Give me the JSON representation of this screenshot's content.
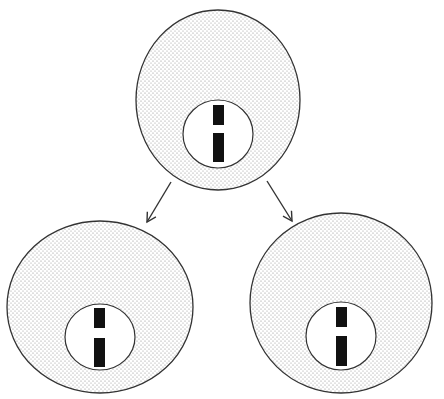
{
  "diagram": {
    "colors": {
      "background": "#ffffff",
      "outline": "#333333",
      "stipple": "#8a8a8a",
      "chromosome": "#111111",
      "arrow": "#333333"
    },
    "cells": [
      {
        "id": "parent",
        "label": "parent cell",
        "outer": {
          "cx": 218,
          "cy": 100,
          "rx": 82,
          "ry": 90
        },
        "nucleus": {
          "cx": 218,
          "cy": 134,
          "rx": 35,
          "ry": 34
        },
        "chromosome_bars": [
          {
            "x": 213,
            "y": 105,
            "w": 11,
            "h": 20
          },
          {
            "x": 213,
            "y": 133,
            "w": 11,
            "h": 29
          }
        ]
      },
      {
        "id": "daughter-left",
        "label": "daughter cell (left)",
        "outer": {
          "cx": 100,
          "cy": 307,
          "rx": 93,
          "ry": 86
        },
        "nucleus": {
          "cx": 100,
          "cy": 337,
          "rx": 35,
          "ry": 33
        },
        "chromosome_bars": [
          {
            "x": 94,
            "y": 308,
            "w": 11,
            "h": 20
          },
          {
            "x": 94,
            "y": 338,
            "w": 11,
            "h": 29
          }
        ]
      },
      {
        "id": "daughter-right",
        "label": "daughter cell (right)",
        "outer": {
          "cx": 341,
          "cy": 303,
          "rx": 91,
          "ry": 90
        },
        "nucleus": {
          "cx": 341,
          "cy": 336,
          "rx": 35,
          "ry": 34
        },
        "chromosome_bars": [
          {
            "x": 336,
            "y": 307,
            "w": 11,
            "h": 20
          },
          {
            "x": 336,
            "y": 336,
            "w": 11,
            "h": 30
          }
        ]
      }
    ],
    "arrows": [
      {
        "id": "arrow-left",
        "x1": 171,
        "y1": 182,
        "x2": 147,
        "y2": 222
      },
      {
        "id": "arrow-right",
        "x1": 267,
        "y1": 181,
        "x2": 292,
        "y2": 221
      }
    ]
  }
}
